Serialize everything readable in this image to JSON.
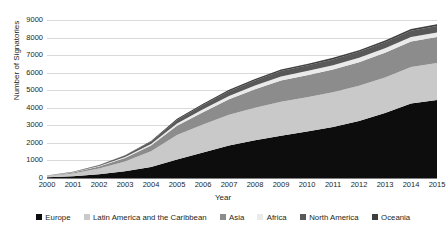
{
  "chart_data": {
    "type": "area",
    "stacked": true,
    "title": "",
    "xlabel": "Year",
    "ylabel": "Number of Signatories",
    "x": [
      2000,
      2001,
      2002,
      2003,
      2004,
      2005,
      2006,
      2007,
      2008,
      2009,
      2010,
      2011,
      2012,
      2013,
      2014,
      2015
    ],
    "xtick_labels": [
      "2000",
      "2001",
      "2002",
      "2003",
      "2004",
      "2005",
      "2006",
      "2007",
      "2008",
      "2009",
      "2010",
      "2011",
      "2012",
      "2013",
      "2014",
      "2015"
    ],
    "ylim": [
      0,
      9000
    ],
    "ytick_labels": [
      "0",
      "1000",
      "2000",
      "3000",
      "4000",
      "5000",
      "6000",
      "7000",
      "8000",
      "9000"
    ],
    "yticks": [
      0,
      1000,
      2000,
      3000,
      4000,
      5000,
      6000,
      7000,
      8000,
      9000
    ],
    "grid": true,
    "legend_position": "bottom",
    "series": [
      {
        "name": "Europe",
        "color": "#0d0d0d",
        "values": [
          40,
          100,
          210,
          380,
          620,
          1050,
          1450,
          1850,
          2150,
          2400,
          2650,
          2900,
          3250,
          3700,
          4250,
          4450
        ]
      },
      {
        "name": "Latin America and the Caribbean",
        "color": "#c9c9c9",
        "values": [
          60,
          160,
          330,
          560,
          900,
          1400,
          1600,
          1750,
          1850,
          1950,
          1950,
          1980,
          2000,
          2030,
          2070,
          2100
        ]
      },
      {
        "name": "Asia",
        "color": "#8c8c8c",
        "values": [
          20,
          50,
          110,
          200,
          330,
          520,
          700,
          880,
          1050,
          1200,
          1250,
          1300,
          1350,
          1400,
          1450,
          1480
        ]
      },
      {
        "name": "Africa",
        "color": "#eaeaea",
        "values": [
          5,
          15,
          30,
          55,
          90,
          140,
          170,
          195,
          215,
          235,
          240,
          245,
          250,
          255,
          260,
          265
        ]
      },
      {
        "name": "North America",
        "color": "#595959",
        "values": [
          8,
          20,
          45,
          80,
          130,
          200,
          240,
          270,
          290,
          310,
          320,
          330,
          340,
          350,
          360,
          365
        ]
      },
      {
        "name": "Oceania",
        "color": "#3f3f3f",
        "values": [
          3,
          8,
          15,
          25,
          40,
          60,
          70,
          78,
          84,
          88,
          90,
          92,
          94,
          96,
          98,
          100
        ]
      }
    ],
    "totals": [
      136,
      353,
      740,
      1300,
      2110,
      3370,
      4230,
      5023,
      5639,
      6183,
      6500,
      6847,
      7284,
      7831,
      8488,
      8760
    ]
  }
}
